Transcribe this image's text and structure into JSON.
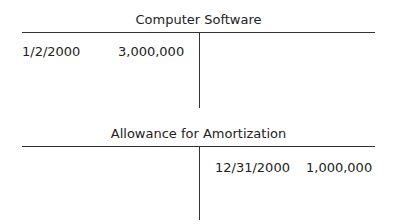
{
  "accounts": [
    {
      "title": "Computer Software",
      "debits": [
        {
          "date": "1/2/2000",
          "amount": "3,000,000"
        }
      ],
      "credits": []
    },
    {
      "title": "Allowance for Amortization",
      "debits": [],
      "credits": [
        {
          "date": "12/31/2000",
          "amount": "1,000,000"
        }
      ]
    }
  ]
}
